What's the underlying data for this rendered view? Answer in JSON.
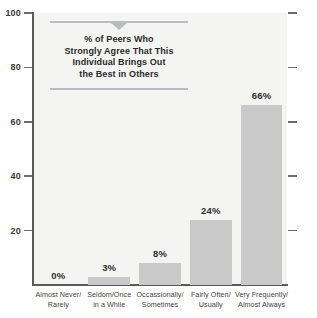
{
  "chart_data": {
    "type": "bar",
    "title": "",
    "xlabel": "",
    "ylabel": "",
    "ylim": [
      0,
      100
    ],
    "grid": false,
    "legend": false,
    "categories": [
      "Almost Never/ Rarely",
      "Seldom/Once in a While",
      "Occassionally/ Sometimes",
      "Fairly Often/ Usually",
      "Very Frequently/ Almost Always"
    ],
    "category_lines": [
      [
        "Almost Never/",
        "Rarely"
      ],
      [
        "Seldom/Once",
        "in a While"
      ],
      [
        "Occassionally/",
        "Sometimes"
      ],
      [
        "Fairly Often/",
        "Usually"
      ],
      [
        "Very Frequently/",
        "Almost Always"
      ]
    ],
    "values": [
      0,
      3,
      8,
      24,
      66
    ],
    "value_labels": [
      "0%",
      "3%",
      "8%",
      "24%",
      "66%"
    ],
    "yticks": [
      20,
      40,
      60,
      80,
      100
    ],
    "ytick_labels": [
      "20",
      "40",
      "60",
      "80",
      "100"
    ],
    "bar_color": "#c9c9c9",
    "plot_background": "#f4f4f2",
    "axis_color": "#5a5a5a",
    "label_color": "#2e2e2e"
  },
  "annotation": {
    "lines": [
      "% of Peers Who",
      "Strongly Agree That This",
      "Individual Brings Out",
      "the Best in Others"
    ],
    "text": "% of Peers Who Strongly Agree That This Individual Brings Out the Best in Others",
    "rule_color": "#b9bcc0"
  }
}
